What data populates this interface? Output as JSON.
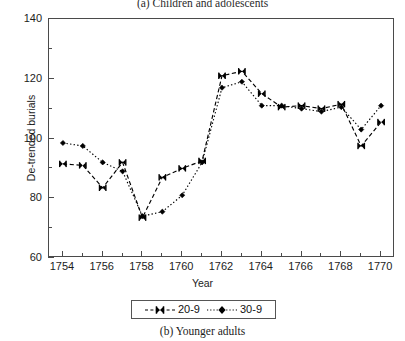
{
  "captions": {
    "top": "(a) Children and adolescents",
    "bottom": "(b) Younger adults"
  },
  "legend": {
    "items": [
      {
        "label": "20-9",
        "marker": "bowtie-x-marker",
        "line": "dashed",
        "color": "#000000"
      },
      {
        "label": "30-9",
        "marker": "filled-diamond-marker",
        "line": "dotted",
        "color": "#000000"
      }
    ]
  },
  "chart_data": {
    "type": "line",
    "title": "(a) Children and adolescents",
    "xlabel": "Year",
    "ylabel": "De-trended burials",
    "xlim": [
      1753.3,
      1770.7
    ],
    "ylim": [
      60,
      140
    ],
    "grid": false,
    "legend_position": "below-plot",
    "x": [
      1754,
      1755,
      1756,
      1757,
      1758,
      1759,
      1760,
      1761,
      1762,
      1763,
      1764,
      1765,
      1766,
      1767,
      1768,
      1769,
      1770
    ],
    "xticks_major": [
      1754,
      1756,
      1758,
      1760,
      1762,
      1764,
      1766,
      1768,
      1770
    ],
    "xticks_minor": [
      1755,
      1757,
      1759,
      1761,
      1763,
      1765,
      1767,
      1769
    ],
    "yticks_major": [
      60,
      80,
      100,
      120,
      140
    ],
    "yticks_minor": [
      70,
      90,
      110,
      130
    ],
    "series": [
      {
        "name": "20-9",
        "marker": "bowtie-x-marker",
        "line": "dashed",
        "color": "#000000",
        "values": [
          91.5,
          91.0,
          83.5,
          92.0,
          73.5,
          87.0,
          90.0,
          92.5,
          121.0,
          122.5,
          115.0,
          110.5,
          111.0,
          110.0,
          111.5,
          97.5,
          105.5
        ]
      },
      {
        "name": "30-9",
        "marker": "filled-diamond-marker",
        "line": "dotted",
        "color": "#000000",
        "values": [
          98.5,
          97.5,
          92.0,
          89.0,
          74.0,
          75.5,
          81.0,
          92.0,
          117.0,
          119.0,
          111.0,
          111.0,
          110.0,
          109.0,
          110.5,
          103.0,
          111.0
        ]
      }
    ]
  }
}
